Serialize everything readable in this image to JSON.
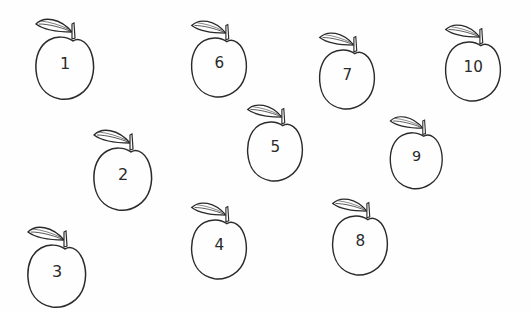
{
  "worksheet": {
    "apples": [
      {
        "label": "1",
        "x": 30,
        "y": 14,
        "size": 1.0
      },
      {
        "label": "2",
        "x": 88,
        "y": 125,
        "size": 1.0
      },
      {
        "label": "3",
        "x": 22,
        "y": 222,
        "size": 1.0
      },
      {
        "label": "4",
        "x": 186,
        "y": 198,
        "size": 0.95
      },
      {
        "label": "5",
        "x": 242,
        "y": 100,
        "size": 0.95
      },
      {
        "label": "6",
        "x": 186,
        "y": 16,
        "size": 0.95
      },
      {
        "label": "7",
        "x": 314,
        "y": 28,
        "size": 0.95
      },
      {
        "label": "8",
        "x": 327,
        "y": 194,
        "size": 0.95
      },
      {
        "label": "9",
        "x": 385,
        "y": 112,
        "size": 0.9
      },
      {
        "label": "10",
        "x": 440,
        "y": 20,
        "size": 0.95
      }
    ],
    "stroke_color": "#2a2a2a",
    "background_color": "#fefefe"
  }
}
